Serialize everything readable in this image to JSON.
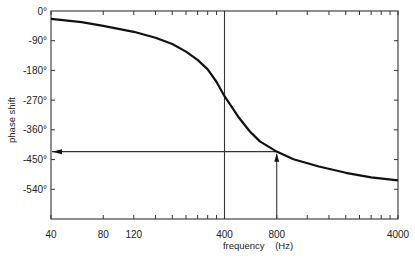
{
  "chart_data": {
    "type": "line",
    "title": "",
    "xlabel": "frequency    (Hz)",
    "ylabel": "phase shift",
    "x_scale": "log",
    "xlim": [
      40,
      4000
    ],
    "ylim": [
      -630,
      0
    ],
    "x_tick_labels": [
      "40",
      "80",
      "120",
      "400",
      "800",
      "4000"
    ],
    "x_tick_values": [
      40,
      80,
      120,
      400,
      800,
      4000
    ],
    "x_minor_ticks": [
      160,
      200,
      240,
      280,
      320,
      360,
      1200,
      1600,
      2000,
      2400,
      2800,
      3200,
      3600
    ],
    "y_tick_labels": [
      "0°",
      "-90°",
      "-180°",
      "-270°",
      "-360°",
      "-450°",
      "-540°"
    ],
    "y_tick_values": [
      0,
      -90,
      -180,
      -270,
      -360,
      -450,
      -540
    ],
    "grid": false,
    "legend": null,
    "series": [
      {
        "name": "phase shift",
        "x": [
          40,
          60,
          80,
          120,
          160,
          200,
          240,
          280,
          320,
          360,
          400,
          480,
          560,
          640,
          800,
          1000,
          1400,
          2000,
          2800,
          4000
        ],
        "y": [
          -24,
          -34,
          -45,
          -63,
          -81,
          -100,
          -123,
          -148,
          -177,
          -215,
          -258,
          -320,
          -365,
          -395,
          -426,
          -449,
          -471,
          -490,
          -504,
          -513
        ]
      }
    ],
    "annotations": [
      {
        "type": "vline",
        "x": 400,
        "label": ""
      },
      {
        "type": "arrow",
        "from": [
          800,
          -630
        ],
        "to": [
          800,
          -426
        ],
        "direction": "up"
      },
      {
        "type": "arrow",
        "from": [
          800,
          -426
        ],
        "to": [
          40,
          -426
        ],
        "direction": "left"
      }
    ]
  }
}
